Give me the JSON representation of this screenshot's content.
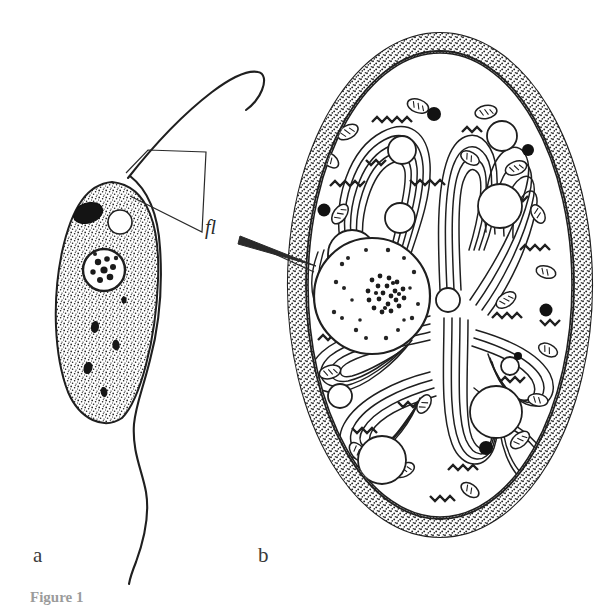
{
  "figure": {
    "caption_partial": "Figure 1",
    "background_color": "#ffffff",
    "ink_color": "#1f1f1f",
    "panels": [
      {
        "id": "a",
        "label": "a",
        "subject": "trophozoite-flagellate-cell",
        "description": "Pear-shaped stippled flagellate cell with anterior and posterior flagella"
      },
      {
        "id": "b",
        "label": "b",
        "subject": "cyst-cross-section",
        "description": "Oval cyst in cross-section showing layered wall, coiled flagellar axonemes, mitochondria, vacuoles and nucleus"
      }
    ],
    "annotations": [
      {
        "name": "fl",
        "label": "fl",
        "meaning": "flagellum",
        "style": "italic",
        "points_to": [
          "panel-a-flagella",
          "panel-b-flagellum"
        ]
      }
    ],
    "structures": {
      "panel_a": [
        "cell-body-stippled",
        "dark-organelle",
        "clear-vacuole",
        "nucleus-with-granular-interior",
        "small-dark-granules",
        "anterior-flagellum",
        "posterior-flagellum"
      ],
      "panel_b": [
        "cyst-wall-outer",
        "cyst-wall-stippled-layer",
        "cyst-wall-radial-striations",
        "flagellar-axonemes",
        "mitochondria",
        "clear-vacuoles",
        "dense-granules",
        "nucleus",
        "nucleolus",
        "chromatin-granules",
        "ribosome-chains"
      ]
    }
  }
}
